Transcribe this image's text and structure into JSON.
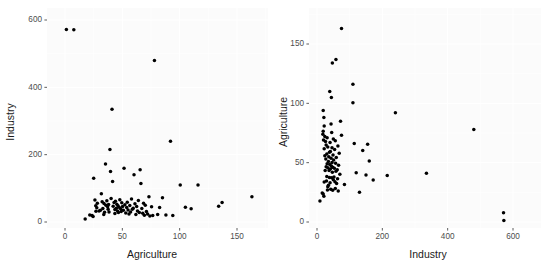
{
  "figure": {
    "background_color": "#ffffff",
    "panel_color": "#fbfbfb",
    "gridline_color": "#ffffff",
    "point_color": "#000000",
    "tick_color": "#4d4d4d",
    "axis_title_color": "#1a1a1a"
  },
  "chart_data": [
    {
      "type": "scatter",
      "title": "",
      "xlabel": "Agriculture",
      "ylabel": "Industry",
      "xlim": [
        -4,
        172
      ],
      "ylim": [
        -30,
        620
      ],
      "xticks": [
        0,
        50,
        100,
        150
      ],
      "xtick_labels": [
        "0",
        "50",
        "100",
        "150"
      ],
      "yticks": [
        0,
        200,
        400,
        600
      ],
      "ytick_labels": [
        "0",
        "200",
        "400",
        "600"
      ],
      "grid": true,
      "legend": "none",
      "n_points": 94,
      "x": [
        1.2,
        7.7,
        17.6,
        21.6,
        23.6,
        24.5,
        25.0,
        26.1,
        26.8,
        27.0,
        27.7,
        28.2,
        29.7,
        30.9,
        31.7,
        32.4,
        33.0,
        33.8,
        34.0,
        34.5,
        35.3,
        35.7,
        36.5,
        37.2,
        37.6,
        38.0,
        38.4,
        39.2,
        39.7,
        40.2,
        41.0,
        41.5,
        42.0,
        42.8,
        43.5,
        43.5,
        44.0,
        44.7,
        45.2,
        45.8,
        46.2,
        46.6,
        47.2,
        47.8,
        48.5,
        49.0,
        49.5,
        50.2,
        50.9,
        51.5,
        52.2,
        53.0,
        53.8,
        54.3,
        55.0,
        55.8,
        56.5,
        57.2,
        58.0,
        58.7,
        59.5,
        60.2,
        61.0,
        61.8,
        62.5,
        63.2,
        64.0,
        64.8,
        65.5,
        66.2,
        67.0,
        67.8,
        68.5,
        69.2,
        70.0,
        71.0,
        72.0,
        73.2,
        74.0,
        75.5,
        76.5,
        78.0,
        80.8,
        82.5,
        85.0,
        88.0,
        92.0,
        94.0,
        100.5,
        105.0,
        110.0,
        116.0,
        134.0,
        137.0,
        163.0
      ],
      "y": [
        572.0,
        571.0,
        9.0,
        21.0,
        19.0,
        16.0,
        130.0,
        65.0,
        48.0,
        32.0,
        42.0,
        56.0,
        33.0,
        35.0,
        84.0,
        60.0,
        40.0,
        22.0,
        55.0,
        29.0,
        172.0,
        50.0,
        63.0,
        45.0,
        38.0,
        52.0,
        30.0,
        215.0,
        150.0,
        70.0,
        335.0,
        120.0,
        47.0,
        58.0,
        37.0,
        25.0,
        62.0,
        41.0,
        53.0,
        33.0,
        48.0,
        28.0,
        44.0,
        66.0,
        39.0,
        31.0,
        57.0,
        46.0,
        35.0,
        160.0,
        51.0,
        27.0,
        43.0,
        59.0,
        36.0,
        24.0,
        49.0,
        30.0,
        68.0,
        38.0,
        41.0,
        140.0,
        54.0,
        22.0,
        46.0,
        33.0,
        64.0,
        28.0,
        155.0,
        114.0,
        40.0,
        26.0,
        56.0,
        20.0,
        50.0,
        31.0,
        24.0,
        75.0,
        18.0,
        45.0,
        19.0,
        480.0,
        22.0,
        43.0,
        72.0,
        21.0,
        240.0,
        19.0,
        110.0,
        44.0,
        39.0,
        110.0,
        47.0,
        58.0,
        75.0
      ]
    },
    {
      "type": "scatter",
      "title": "",
      "xlabel": "Industry",
      "ylabel": "Agriculture",
      "xlim": [
        -26,
        620
      ],
      "ylim": [
        -8,
        172
      ],
      "xticks": [
        0,
        200,
        400,
        600
      ],
      "xtick_labels": [
        "0",
        "200",
        "400",
        "600"
      ],
      "yticks": [
        0,
        50,
        100,
        150
      ],
      "ytick_labels": [
        "0",
        "50",
        "100",
        "150"
      ],
      "grid": true,
      "legend": "none",
      "n_points": 94,
      "note": "Same observations as left panel with axes swapped"
    }
  ]
}
